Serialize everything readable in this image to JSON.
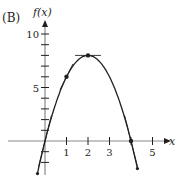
{
  "panel_label": "(B)",
  "colors": {
    "ink": "#231f20",
    "axis": "#8a8a8a"
  },
  "chart_data": {
    "type": "line",
    "title": "",
    "panel_label": "(B)",
    "xlabel": "x",
    "ylabel": "f(x)",
    "function": "f(x) = 8x - 2x^2",
    "x_ticks": [
      1,
      2,
      3,
      4,
      5
    ],
    "x_tick_labels": [
      "1",
      "2",
      "3",
      "",
      "5"
    ],
    "y_ticks": [
      -2,
      -1,
      1,
      2,
      3,
      4,
      5,
      6,
      7,
      8,
      9,
      10
    ],
    "y_tick_labels": {
      "5": "5",
      "10": "10"
    },
    "xlim": [
      -0.6,
      5.8
    ],
    "ylim": [
      -3.2,
      11
    ],
    "grid": false,
    "series": [
      {
        "name": "f(x)",
        "x": [
          -0.35,
          0,
          0.5,
          1,
          1.5,
          2,
          2.5,
          3,
          3.5,
          4,
          4.3
        ],
        "values": [
          -3.05,
          0,
          3.5,
          6,
          7.5,
          8,
          7.5,
          6,
          3.5,
          0,
          -2.58
        ]
      }
    ],
    "tangent_lines": [
      {
        "at_x": 0,
        "point": [
          0,
          0
        ],
        "slope": 8
      },
      {
        "at_x": 1,
        "point": [
          1,
          6
        ],
        "slope": 4
      },
      {
        "at_x": 2,
        "point": [
          2,
          8
        ],
        "slope": 0
      },
      {
        "at_x": 4,
        "point": [
          4,
          0
        ],
        "slope": -8
      }
    ],
    "marked_points": [
      [
        1,
        6
      ],
      [
        2,
        8
      ],
      [
        4,
        0
      ]
    ]
  }
}
